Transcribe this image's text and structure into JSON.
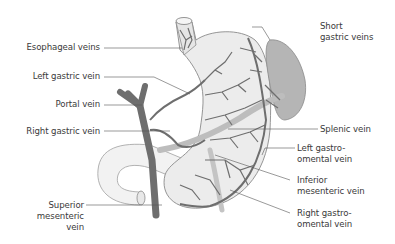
{
  "figure": {
    "colors": {
      "vein": "#6e6e6e",
      "vein_light": "#bdbdbd",
      "stomach_fill": "#ececec",
      "stomach_outline": "#8a8a8a",
      "spleen_fill": "#b5b5b5",
      "duodenum_fill": "#f2f2f2",
      "leader": "#555555",
      "text": "#3a3a3a"
    },
    "labels": {
      "esophageal_veins": "Esophageal veins",
      "left_gastric_vein": "Left gastric vein",
      "portal_vein": "Portal vein",
      "right_gastric_vein": "Right gastric vein",
      "superior_mesenteric_vein": "Superior\nmesenteric\nvein",
      "short_gastric_veins": "Short\ngastric veins",
      "splenic_vein": "Splenic vein",
      "left_gastro_omental_vein": "Left gastro-\nomental vein",
      "inferior_mesenteric_vein": "Inferior\nmesenteric vein",
      "right_gastro_omental_vein": "Right gastro-\nomental vein"
    }
  }
}
